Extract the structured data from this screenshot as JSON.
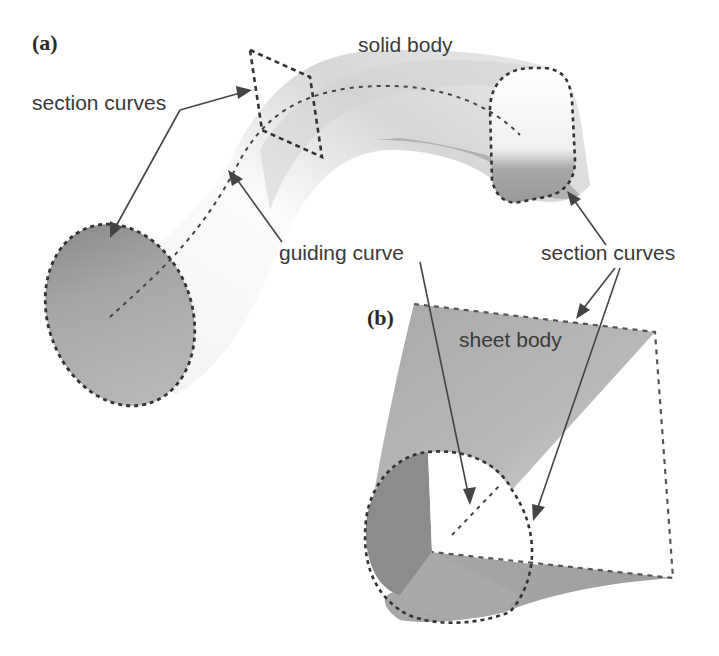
{
  "figure": {
    "panels": [
      {
        "id": "a",
        "label": "(a)",
        "body_label": "solid body",
        "annotations": {
          "section_curves_left": "section curves",
          "guiding_curve": "guiding curve",
          "section_curves_right": "section curves"
        }
      },
      {
        "id": "b",
        "label": "(b)",
        "body_label": "sheet body"
      }
    ],
    "colors": {
      "background": "#ffffff",
      "solid_light": "#e6e6e6",
      "solid_mid": "#c9c9c9",
      "solid_dark": "#9a9a9a",
      "sheet_fill": "#b3b3b3",
      "sheet_dark": "#8c8c8c",
      "dashed_curve": "#333333",
      "leader_line": "#444444",
      "text": "#3a3a3a"
    }
  }
}
